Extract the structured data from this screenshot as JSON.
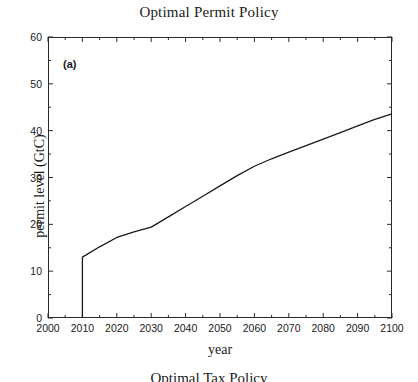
{
  "figure": {
    "panel_label": "(a)",
    "next_figure_title": "Optimal Tax Policy"
  },
  "chart_data": {
    "type": "line",
    "title": "Optimal Permit Policy",
    "xlabel": "year",
    "ylabel": "permit level (GtC)",
    "xlim": [
      2000,
      2100
    ],
    "ylim": [
      0,
      60
    ],
    "xticks": [
      2000,
      2010,
      2020,
      2030,
      2040,
      2050,
      2060,
      2070,
      2080,
      2090,
      2100
    ],
    "yticks": [
      0,
      10,
      20,
      30,
      40,
      50,
      60
    ],
    "grid": false,
    "legend": null,
    "line_color": "#1a1a1a",
    "series": [
      {
        "name": "permit level",
        "x": [
          2010,
          2010,
          2015,
          2020,
          2025,
          2030,
          2035,
          2040,
          2045,
          2050,
          2055,
          2060,
          2065,
          2070,
          2075,
          2080,
          2085,
          2090,
          2095,
          2100
        ],
        "values": [
          0,
          13.0,
          15.2,
          17.2,
          18.4,
          19.4,
          21.6,
          23.8,
          26.0,
          28.2,
          30.4,
          32.4,
          34.0,
          35.4,
          36.8,
          38.2,
          39.6,
          41.0,
          42.4,
          43.6
        ]
      }
    ]
  }
}
